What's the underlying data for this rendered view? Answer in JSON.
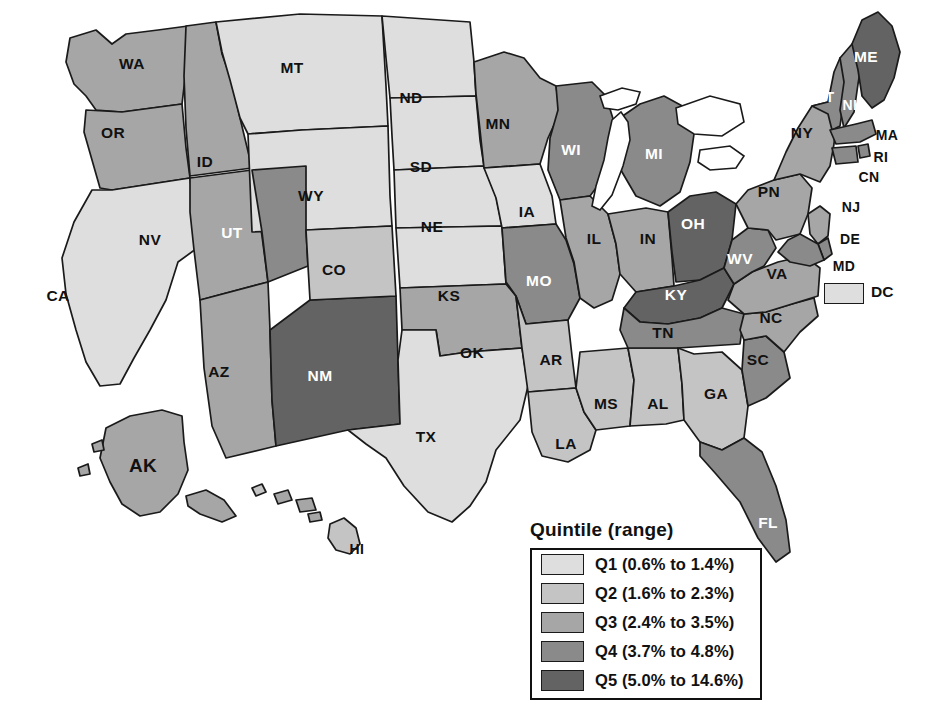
{
  "figure": {
    "type": "choropleth-map",
    "region": "United States",
    "background": "#ffffff"
  },
  "legend": {
    "title": "Quintile (range)",
    "items": [
      {
        "key": "Q1",
        "label": "Q1 (0.6% to 1.4%)",
        "color": "#dedede",
        "range_low": 0.6,
        "range_high": 1.4
      },
      {
        "key": "Q2",
        "label": "Q2 (1.6% to 2.3%)",
        "color": "#c4c4c4",
        "range_low": 1.6,
        "range_high": 2.3
      },
      {
        "key": "Q3",
        "label": "Q3 (2.4% to 3.5%)",
        "color": "#a6a6a6",
        "range_low": 2.4,
        "range_high": 3.5
      },
      {
        "key": "Q4",
        "label": "Q4 (3.7% to 4.8%)",
        "color": "#8a8a8a",
        "range_low": 3.7,
        "range_high": 4.8
      },
      {
        "key": "Q5",
        "label": "Q5 (5.0% to 14.6%)",
        "color": "#636363",
        "range_low": 5.0,
        "range_high": 14.6
      }
    ]
  },
  "dc_inset": {
    "label": "DC",
    "quintile": "Q1",
    "color": "#dedede"
  },
  "chart_data": {
    "type": "heatmap",
    "title": "Quintile (range)",
    "categories": [
      "Q1",
      "Q2",
      "Q3",
      "Q4",
      "Q5"
    ],
    "states": [
      {
        "code": "WA",
        "quintile": "Q3",
        "x": 132,
        "y": 64
      },
      {
        "code": "OR",
        "quintile": "Q3",
        "x": 113,
        "y": 133
      },
      {
        "code": "CA",
        "quintile": "Q1",
        "x": 58,
        "y": 296
      },
      {
        "code": "NV",
        "quintile": "Q3",
        "x": 150,
        "y": 240
      },
      {
        "code": "ID",
        "quintile": "Q3",
        "x": 205,
        "y": 162
      },
      {
        "code": "MT",
        "quintile": "Q1",
        "x": 292,
        "y": 68
      },
      {
        "code": "WY",
        "quintile": "Q1",
        "x": 311,
        "y": 196
      },
      {
        "code": "UT",
        "quintile": "Q4",
        "x": 232,
        "y": 233
      },
      {
        "code": "AZ",
        "quintile": "Q3",
        "x": 219,
        "y": 372
      },
      {
        "code": "NM",
        "quintile": "Q5",
        "x": 320,
        "y": 376
      },
      {
        "code": "CO",
        "quintile": "Q2",
        "x": 334,
        "y": 270
      },
      {
        "code": "ND",
        "quintile": "Q1",
        "x": 411,
        "y": 98
      },
      {
        "code": "SD",
        "quintile": "Q1",
        "x": 421,
        "y": 167
      },
      {
        "code": "NE",
        "quintile": "Q1",
        "x": 432,
        "y": 227
      },
      {
        "code": "KS",
        "quintile": "Q1",
        "x": 449,
        "y": 296
      },
      {
        "code": "OK",
        "quintile": "Q3",
        "x": 472,
        "y": 353
      },
      {
        "code": "TX",
        "quintile": "Q1",
        "x": 426,
        "y": 437
      },
      {
        "code": "MN",
        "quintile": "Q3",
        "x": 498,
        "y": 124
      },
      {
        "code": "IA",
        "quintile": "Q1",
        "x": 527,
        "y": 212
      },
      {
        "code": "MO",
        "quintile": "Q4",
        "x": 539,
        "y": 281
      },
      {
        "code": "AR",
        "quintile": "Q2",
        "x": 551,
        "y": 360
      },
      {
        "code": "LA",
        "quintile": "Q2",
        "x": 566,
        "y": 444
      },
      {
        "code": "WI",
        "quintile": "Q4",
        "x": 571,
        "y": 150
      },
      {
        "code": "IL",
        "quintile": "Q3",
        "x": 594,
        "y": 239
      },
      {
        "code": "MS",
        "quintile": "Q2",
        "x": 606,
        "y": 404
      },
      {
        "code": "MI",
        "quintile": "Q4",
        "x": 654,
        "y": 154
      },
      {
        "code": "IN",
        "quintile": "Q3",
        "x": 648,
        "y": 239
      },
      {
        "code": "AL",
        "quintile": "Q2",
        "x": 658,
        "y": 404
      },
      {
        "code": "OH",
        "quintile": "Q5",
        "x": 693,
        "y": 224
      },
      {
        "code": "KY",
        "quintile": "Q5",
        "x": 676,
        "y": 295
      },
      {
        "code": "TN",
        "quintile": "Q4",
        "x": 663,
        "y": 333
      },
      {
        "code": "GA",
        "quintile": "Q2",
        "x": 716,
        "y": 394
      },
      {
        "code": "FL",
        "quintile": "Q4",
        "x": 768,
        "y": 523
      },
      {
        "code": "SC",
        "quintile": "Q4",
        "x": 758,
        "y": 360
      },
      {
        "code": "NC",
        "quintile": "Q3",
        "x": 771,
        "y": 318
      },
      {
        "code": "VA",
        "quintile": "Q3",
        "x": 777,
        "y": 274
      },
      {
        "code": "WV",
        "quintile": "Q4",
        "x": 740,
        "y": 259
      },
      {
        "code": "PN",
        "quintile": "Q3",
        "x": 769,
        "y": 192
      },
      {
        "code": "NY",
        "quintile": "Q3",
        "x": 802,
        "y": 133
      },
      {
        "code": "VT",
        "quintile": "Q4",
        "x": 825,
        "y": 97
      },
      {
        "code": "NH",
        "quintile": "Q4",
        "x": 853,
        "y": 105
      },
      {
        "code": "ME",
        "quintile": "Q5",
        "x": 866,
        "y": 57
      },
      {
        "code": "MA",
        "quintile": "Q4",
        "x": 887,
        "y": 135
      },
      {
        "code": "RI",
        "quintile": "Q4",
        "x": 881,
        "y": 157
      },
      {
        "code": "CN",
        "quintile": "Q4",
        "x": 869,
        "y": 177
      },
      {
        "code": "NJ",
        "quintile": "Q3",
        "x": 851,
        "y": 207
      },
      {
        "code": "DE",
        "quintile": "Q4",
        "x": 850,
        "y": 239
      },
      {
        "code": "MD",
        "quintile": "Q4",
        "x": 844,
        "y": 266
      },
      {
        "code": "AK",
        "quintile": "Q3",
        "x": 143,
        "y": 465
      },
      {
        "code": "HI",
        "quintile": "Q2",
        "x": 357,
        "y": 549
      },
      {
        "code": "DC",
        "quintile": "Q1",
        "x": 871,
        "y": 292
      }
    ],
    "counts": {
      "Q1": 10,
      "Q2": 8,
      "Q3": 15,
      "Q4": 13,
      "Q5": 4
    },
    "legend_position": "bottom-center"
  }
}
